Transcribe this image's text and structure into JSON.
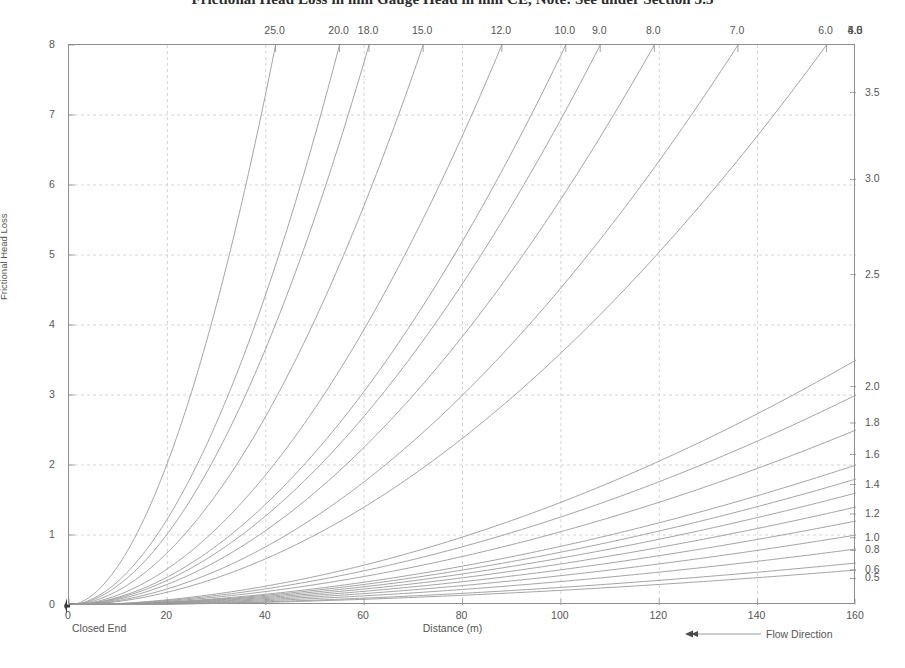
{
  "title": "Frictional Head Loss in mm Gauge Head in mm CE, Note: See under Section 3.3",
  "axes": {
    "y_label": "Frictional Head Loss",
    "x_label": "Distance (m)",
    "origin_note": "Closed End",
    "x_ticks": [
      "0",
      "20",
      "40",
      "60",
      "80",
      "100",
      "120",
      "140",
      "160"
    ],
    "y_ticks": [
      "0",
      "1",
      "2",
      "3",
      "4",
      "5",
      "6",
      "7",
      "8"
    ],
    "top_ticks": [
      "25.0",
      "20.0",
      "18.0",
      "15.0",
      "12.0",
      "10.0",
      "9.0",
      "8.0",
      "7.0",
      "6.0",
      "5.0",
      "4.5",
      "4.0"
    ],
    "right_ticks": [
      "3.5",
      "3.0",
      "2.5",
      "2.0",
      "1.8",
      "1.6",
      "1.4",
      "1.2",
      "1.0",
      "0.8",
      "0.6",
      "0.5"
    ]
  },
  "legend": {
    "flow_direction": "Flow Direction",
    "arrow_icon": "left-arrow-icon"
  },
  "colors": {
    "curve": "#9a9a9a",
    "grid": "#c9c9d4",
    "frame": "#8e8e8e",
    "text": "#555555",
    "background": "#ffffff"
  },
  "chart_data": {
    "type": "line",
    "title": "Frictional Head Loss in mm Gauge Head in mm CE, Note: See under Section 3.3",
    "xlabel": "Distance (m)",
    "ylabel": "Frictional Head Loss",
    "xlim": [
      0,
      160
    ],
    "ylim": [
      0,
      8
    ],
    "grid": true,
    "legend_position": "top-axis-and-right-axis",
    "x_tick_values": [
      0,
      20,
      40,
      60,
      80,
      100,
      120,
      140,
      160
    ],
    "y_tick_values": [
      0,
      1,
      2,
      3,
      4,
      5,
      6,
      7,
      8
    ],
    "top_axis_label": "Flow rate / pipe size",
    "top_axis_tick_values": [
      25.0,
      20.0,
      18.0,
      15.0,
      12.0,
      10.0,
      9.0,
      8.0,
      7.0,
      6.0,
      5.0,
      4.5,
      4.0
    ],
    "top_axis_tick_x_positions_m": [
      42,
      55,
      61,
      72,
      88,
      101,
      108,
      119,
      136,
      154,
      160,
      160,
      160
    ],
    "right_axis_tick_values": [
      3.5,
      3.0,
      2.5,
      2.0,
      1.8,
      1.6,
      1.4,
      1.2,
      1.0,
      0.8,
      0.6,
      0.5
    ],
    "right_axis_tick_y_positions": [
      7.32,
      6.08,
      4.72,
      3.12,
      2.6,
      2.15,
      1.72,
      1.3,
      0.96,
      0.78,
      0.5,
      0.38
    ],
    "annotations": [
      "Closed End",
      "Flow Direction"
    ],
    "note": "Family of power-law head-loss curves h = k * x^1.85, one per labelled size; curves exiting the top edge are labelled on the top axis, curves reaching the right edge are labelled on the right axis.",
    "series": [
      {
        "name": "25.0",
        "exit": "top",
        "k": 8.0,
        "x_end": 42,
        "exponent": 1.85
      },
      {
        "name": "20.0",
        "exit": "top",
        "k": 8.0,
        "x_end": 55,
        "exponent": 1.85
      },
      {
        "name": "18.0",
        "exit": "top",
        "k": 8.0,
        "x_end": 61,
        "exponent": 1.85
      },
      {
        "name": "15.0",
        "exit": "top",
        "k": 8.0,
        "x_end": 72,
        "exponent": 1.85
      },
      {
        "name": "12.0",
        "exit": "top",
        "k": 8.0,
        "x_end": 88,
        "exponent": 1.85
      },
      {
        "name": "10.0",
        "exit": "top",
        "k": 8.0,
        "x_end": 101,
        "exponent": 1.85
      },
      {
        "name": "9.0",
        "exit": "top",
        "k": 8.0,
        "x_end": 108,
        "exponent": 1.85
      },
      {
        "name": "8.0",
        "exit": "top",
        "k": 8.0,
        "x_end": 119,
        "exponent": 1.85
      },
      {
        "name": "7.0",
        "exit": "top",
        "k": 8.0,
        "x_end": 136,
        "exponent": 1.85
      },
      {
        "name": "6.0",
        "exit": "top",
        "k": 8.0,
        "x_end": 154,
        "exponent": 1.85
      },
      {
        "name": "5.0",
        "exit": "right",
        "y_end": 3.5,
        "exponent": 1.85
      },
      {
        "name": "4.5",
        "exit": "right",
        "y_end": 3.0,
        "exponent": 1.85
      },
      {
        "name": "4.0",
        "exit": "right",
        "y_end": 2.5,
        "exponent": 1.85
      },
      {
        "name": "r2.0",
        "exit": "right",
        "y_end": 2.0,
        "exponent": 1.85
      },
      {
        "name": "r1.8",
        "exit": "right",
        "y_end": 1.8,
        "exponent": 1.85
      },
      {
        "name": "r1.6",
        "exit": "right",
        "y_end": 1.6,
        "exponent": 1.85
      },
      {
        "name": "r1.4",
        "exit": "right",
        "y_end": 1.4,
        "exponent": 1.85
      },
      {
        "name": "r1.2",
        "exit": "right",
        "y_end": 1.2,
        "exponent": 1.85
      },
      {
        "name": "r1.0",
        "exit": "right",
        "y_end": 1.0,
        "exponent": 1.85
      },
      {
        "name": "r0.8",
        "exit": "right",
        "y_end": 0.8,
        "exponent": 1.85
      },
      {
        "name": "r0.6",
        "exit": "right",
        "y_end": 0.6,
        "exponent": 1.85
      },
      {
        "name": "r0.5",
        "exit": "right",
        "y_end": 0.5,
        "exponent": 1.85
      }
    ]
  }
}
